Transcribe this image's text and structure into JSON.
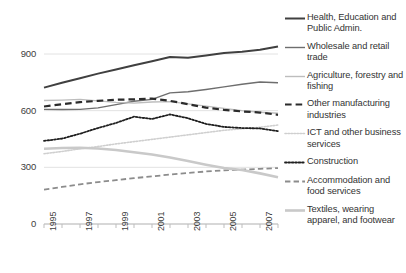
{
  "chart_data": {
    "type": "line",
    "title": "",
    "subtitle": "",
    "xlabel": "",
    "ylabel": "",
    "grid": true,
    "legend_position": "right",
    "ylim": [
      0,
      1000
    ],
    "yticks": [
      0,
      300,
      600,
      900
    ],
    "ytick_labels": [
      "0",
      "300",
      "600",
      "900"
    ],
    "x": [
      1995,
      1996,
      1997,
      1998,
      1999,
      2000,
      2001,
      2002,
      2003,
      2004,
      2005,
      2006,
      2007,
      2008
    ],
    "xticks": [
      1995,
      1996,
      1997,
      1998,
      1999,
      2000,
      2001,
      2002,
      2003,
      2004,
      2005,
      2006,
      2007,
      2008
    ],
    "xtick_labels": [
      "1995",
      "",
      "1997",
      "",
      "1999",
      "",
      "2001",
      "",
      "2003",
      "",
      "2005",
      "",
      "2007",
      ""
    ],
    "xlim": [
      1995,
      2008
    ],
    "series": [
      {
        "name": "Health, Education and Public Admin.",
        "legend_label": "Health, Education and Public Admin.",
        "color": "#404040",
        "style": "solid",
        "width": 2.0,
        "values": [
          722,
          748,
          772,
          796,
          818,
          840,
          862,
          884,
          880,
          892,
          905,
          912,
          922,
          940
        ]
      },
      {
        "name": "Wholesale and retail trade",
        "legend_label": "Wholesale and retail trade",
        "color": "#6e6e6e",
        "style": "solid",
        "width": 1.4,
        "values": [
          607,
          606,
          607,
          615,
          632,
          650,
          660,
          694,
          700,
          712,
          726,
          740,
          752,
          748
        ]
      },
      {
        "name": "Agriculture, forestry and fishing",
        "legend_label": "Agriculture, forestry and fishing",
        "color": "#bdbdbd",
        "style": "solid",
        "width": 1.4,
        "values": [
          654,
          656,
          660,
          652,
          644,
          640,
          646,
          648,
          636,
          624,
          612,
          600,
          592,
          586
        ]
      },
      {
        "name": "Other manufacturing industries",
        "legend_label": "Other manufacturing industries",
        "color": "#2b2b2b",
        "style": "dashed",
        "width": 2.2,
        "values": [
          622,
          634,
          645,
          652,
          658,
          660,
          664,
          652,
          634,
          616,
          604,
          596,
          590,
          578
        ]
      },
      {
        "name": "ICT and other business services",
        "legend_label": "ICT and other business services",
        "color": "#cfcfcf",
        "style": "dotted",
        "width": 1.6,
        "values": [
          372,
          384,
          398,
          410,
          424,
          436,
          448,
          460,
          472,
          484,
          496,
          504,
          512,
          524
        ]
      },
      {
        "name": "Construction",
        "legend_label": "Construction",
        "color": "#1f1f1f",
        "style": "dotted",
        "width": 1.8,
        "values": [
          440,
          452,
          478,
          508,
          535,
          568,
          556,
          580,
          560,
          530,
          514,
          508,
          506,
          492
        ]
      },
      {
        "name": "Accommodation and food services",
        "legend_label": "Accommodation and food services",
        "color": "#8c8c8c",
        "style": "dashed",
        "width": 1.8,
        "values": [
          182,
          196,
          210,
          222,
          232,
          243,
          252,
          262,
          270,
          278,
          284,
          288,
          292,
          296
        ]
      },
      {
        "name": "Textiles, wearing apparel, and footwear",
        "legend_label": "Textiles, wearing apparel, and footwear",
        "color": "#c9c9c9",
        "style": "solid",
        "width": 2.6,
        "values": [
          398,
          402,
          404,
          400,
          392,
          380,
          368,
          352,
          334,
          314,
          296,
          286,
          268,
          248
        ]
      }
    ]
  },
  "axis": {
    "y_ticks": [
      {
        "label": "900"
      },
      {
        "label": "600"
      },
      {
        "label": "300"
      },
      {
        "label": "0"
      }
    ],
    "x_ticks": [
      {
        "label": "1995"
      },
      {
        "label": "1997"
      },
      {
        "label": "1999"
      },
      {
        "label": "2001"
      },
      {
        "label": "2003"
      },
      {
        "label": "2005"
      },
      {
        "label": "2007"
      }
    ]
  },
  "legend": {
    "items": [
      {
        "label": "Health, Education and Public Admin.",
        "marker": "solid-line-dark-icon"
      },
      {
        "label": "Wholesale and retail trade",
        "marker": "solid-line-gray-icon"
      },
      {
        "label": "Agriculture, forestry and fishing",
        "marker": "solid-line-lightgray-icon"
      },
      {
        "label": "Other manufacturing industries",
        "marker": "dashed-line-dark-icon"
      },
      {
        "label": "ICT and other business services",
        "marker": "dotted-line-lightgray-icon"
      },
      {
        "label": "Construction",
        "marker": "dotted-line-dark-icon"
      },
      {
        "label": "Accommodation and food services",
        "marker": "dashed-line-gray-icon"
      },
      {
        "label": "Textiles, wearing apparel, and footwear",
        "marker": "solid-line-thick-lightgray-icon"
      }
    ]
  }
}
